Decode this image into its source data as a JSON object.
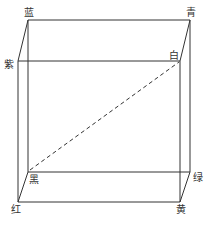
{
  "diagram": {
    "type": "rgb-color-cube",
    "line_color": "#333333",
    "vertices": {
      "blue": {
        "label": "蓝"
      },
      "cyan": {
        "label": "青"
      },
      "purple": {
        "label": "紫"
      },
      "white": {
        "label": "白"
      },
      "black": {
        "label": "黑"
      },
      "green": {
        "label": "绿"
      },
      "red": {
        "label": "红"
      },
      "yellow": {
        "label": "黄"
      }
    },
    "diagonal": {
      "from": "黑",
      "to": "白",
      "style": "dashed"
    }
  }
}
